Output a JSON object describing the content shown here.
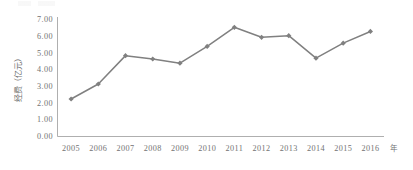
{
  "chart_data": {
    "type": "line",
    "title": "",
    "subtitle": "",
    "xlabel": "年",
    "ylabel": "经费（亿元）",
    "categories": [
      "2005",
      "2006",
      "2007",
      "2008",
      "2009",
      "2010",
      "2011",
      "2012",
      "2013",
      "2014",
      "2015",
      "2016"
    ],
    "values": [
      2.25,
      3.15,
      4.85,
      4.65,
      4.4,
      5.4,
      6.55,
      5.95,
      6.05,
      4.7,
      5.6,
      6.3
    ],
    "series": [
      {
        "name": "经费",
        "values": [
          2.25,
          3.15,
          4.85,
          4.65,
          4.4,
          5.4,
          6.55,
          5.95,
          6.05,
          4.7,
          5.6,
          6.3
        ]
      }
    ],
    "ylim": [
      0,
      7
    ],
    "ytick_step": 1,
    "ytick_labels": [
      "0.00",
      "1.00",
      "2.00",
      "3.00",
      "4.00",
      "5.00",
      "6.00",
      "7.00"
    ],
    "ytick_values": [
      0,
      1,
      2,
      3,
      4,
      5,
      6,
      7
    ],
    "grid": false,
    "legend": "none",
    "marker": "diamond",
    "line_color": "#808080",
    "marker_color": "#808080",
    "axis_color": "#a6a6a6",
    "text_color": "#737373",
    "background": "#ffffff"
  },
  "axis": {
    "y_unit_label": "经费（亿元）",
    "x_unit_label": "年"
  }
}
